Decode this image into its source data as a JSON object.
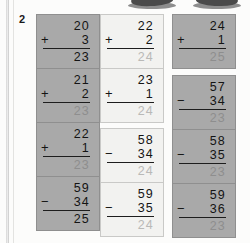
{
  "exercise": {
    "number": "2"
  },
  "grid": {
    "columns": [
      {
        "name": "column-1",
        "cells": [
          {
            "top": "20",
            "operator": "+",
            "bottom": "3",
            "answer": "23",
            "shade": "shade-dark",
            "answer_style": "solid"
          },
          {
            "top": "21",
            "operator": "+",
            "bottom": "2",
            "answer": "23",
            "shade": "shade-dark",
            "answer_style": "dim"
          },
          {
            "top": "22",
            "operator": "+",
            "bottom": "1",
            "answer": "23",
            "shade": "shade-dark",
            "answer_style": "dim"
          },
          {
            "top": "59",
            "operator": "−",
            "bottom": "34",
            "answer": "25",
            "shade": "shade-dark",
            "answer_style": "solid"
          }
        ]
      },
      {
        "name": "column-2",
        "cells": [
          {
            "top": "22",
            "operator": "+",
            "bottom": "2",
            "answer": "24",
            "shade": "shade-light",
            "answer_style": "dim-light"
          },
          {
            "top": "23",
            "operator": "+",
            "bottom": "1",
            "answer": "24",
            "shade": "shade-light",
            "answer_style": "dim-light"
          },
          {
            "top": "58",
            "operator": "−",
            "bottom": "34",
            "answer": "24",
            "shade": "shade-light",
            "answer_style": "dim-light"
          },
          {
            "top": "59",
            "operator": "−",
            "bottom": "35",
            "answer": "24",
            "shade": "shade-light",
            "answer_style": "dim-light"
          }
        ]
      },
      {
        "name": "column-3",
        "cells": [
          {
            "top": "24",
            "operator": "+",
            "bottom": "1",
            "answer": "25",
            "shade": "shade-mid",
            "answer_style": "dim"
          },
          {
            "top": "57",
            "operator": "−",
            "bottom": "34",
            "answer": "23",
            "shade": "shade-mid",
            "answer_style": "dim"
          },
          {
            "top": "58",
            "operator": "−",
            "bottom": "35",
            "answer": "23",
            "shade": "shade-mid",
            "answer_style": "dim"
          },
          {
            "top": "59",
            "operator": "−",
            "bottom": "36",
            "answer": "23",
            "shade": "shade-mid",
            "answer_style": "dim"
          }
        ]
      }
    ]
  }
}
